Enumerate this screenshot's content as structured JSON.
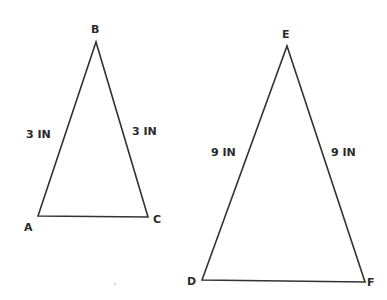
{
  "triangles": [
    {
      "name": "ABC",
      "vertices": {
        "A": {
          "label": "A",
          "x": 38,
          "y": 216
        },
        "B": {
          "label": "B",
          "x": 96,
          "y": 42
        },
        "C": {
          "label": "C",
          "x": 148,
          "y": 217
        }
      },
      "sides": {
        "AB": "3 IN",
        "BC": "3 IN"
      }
    },
    {
      "name": "DEF",
      "vertices": {
        "D": {
          "label": "D",
          "x": 202,
          "y": 280
        },
        "E": {
          "label": "E",
          "x": 287,
          "y": 46
        },
        "F": {
          "label": "F",
          "x": 365,
          "y": 282
        }
      },
      "sides": {
        "DE": "9 IN",
        "EF": "9 IN"
      }
    }
  ],
  "colors": {
    "stroke": "#333333",
    "text": "#2a2a2a",
    "background": "#ffffff"
  }
}
